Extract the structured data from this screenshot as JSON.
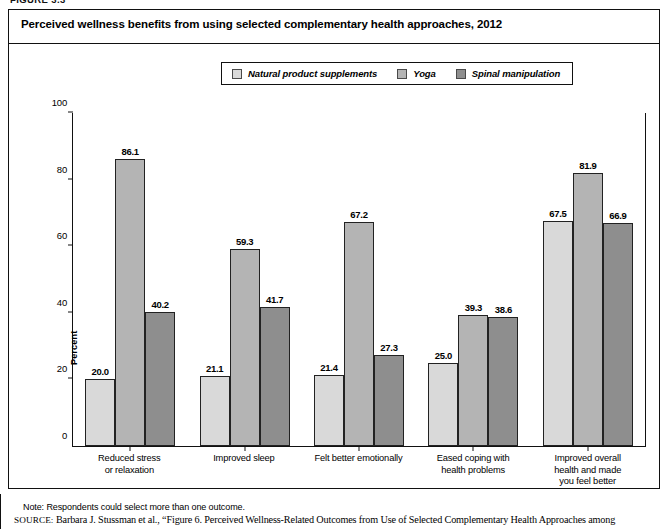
{
  "figure": {
    "number_label": "FIGURE 3.3",
    "title": "Perceived wellness benefits from using selected complementary health approaches, 2012"
  },
  "legend": {
    "items": [
      {
        "label": "Natural product supplements",
        "color": "#d9d9d9"
      },
      {
        "label": "Yoga",
        "color": "#b4b4b4"
      },
      {
        "label": "Spinal manipulation",
        "color": "#8e8e8e"
      }
    ]
  },
  "axes": {
    "ylabel": "Percent",
    "yticks": [
      "0",
      "20",
      "40",
      "60",
      "80",
      "100"
    ]
  },
  "note": "Note: Respondents could select more than one outcome.",
  "source": {
    "label": "SOURCE:",
    "text": "Barbara J. Stussman et al., “Figure 6. Perceived Wellness-Related Outcomes from Use of Selected Complementary Health Approaches among"
  },
  "chart_data": {
    "type": "bar",
    "title": "Perceived wellness benefits from using selected complementary health approaches, 2012",
    "xlabel": "",
    "ylabel": "Percent",
    "ylim": [
      0,
      100
    ],
    "ytick_step": 20,
    "grid": false,
    "legend_position": "top-center",
    "categories": [
      "Reduced stress\nor relaxation",
      "Improved sleep",
      "Felt better emotionally",
      "Eased coping with\nhealth problems",
      "Improved overall\nhealth and made\nyou feel better"
    ],
    "category_lines": [
      [
        "Reduced stress",
        "or relaxation"
      ],
      [
        "Improved sleep"
      ],
      [
        "Felt better emotionally"
      ],
      [
        "Eased coping with",
        "health problems"
      ],
      [
        "Improved overall",
        "health and made",
        "you feel better"
      ]
    ],
    "series": [
      {
        "name": "Natural product supplements",
        "color": "#d9d9d9",
        "values": [
          20.0,
          21.1,
          21.4,
          25.0,
          67.5
        ]
      },
      {
        "name": "Yoga",
        "color": "#b4b4b4",
        "values": [
          86.1,
          59.3,
          67.2,
          39.3,
          81.9
        ]
      },
      {
        "name": "Spinal manipulation",
        "color": "#8e8e8e",
        "values": [
          40.2,
          41.7,
          27.3,
          38.6,
          66.9
        ]
      }
    ],
    "value_labels": [
      [
        "20.0",
        "86.1",
        "40.2"
      ],
      [
        "21.1",
        "59.3",
        "41.7"
      ],
      [
        "21.4",
        "67.2",
        "27.3"
      ],
      [
        "25.0",
        "39.3",
        "38.6"
      ],
      [
        "67.5",
        "81.9",
        "66.9"
      ]
    ]
  }
}
